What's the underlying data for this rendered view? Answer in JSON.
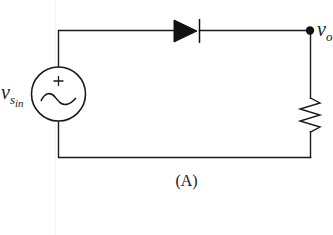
{
  "figure": {
    "caption": "(A)"
  },
  "components": {
    "source": {
      "type": "ac-voltage-source",
      "label_main": "v",
      "label_sub": "s",
      "label_subsub": "in",
      "polarity_mark": "+",
      "waveform_symbol": "~"
    },
    "diode": {
      "type": "diode",
      "orientation": "anode-left, cathode-right"
    },
    "resistor": {
      "type": "resistor",
      "orientation": "vertical"
    },
    "output_node": {
      "label_main": "v",
      "label_sub": "o"
    }
  },
  "colors": {
    "stroke": "#1a1a1a",
    "background": "#ffffff"
  }
}
